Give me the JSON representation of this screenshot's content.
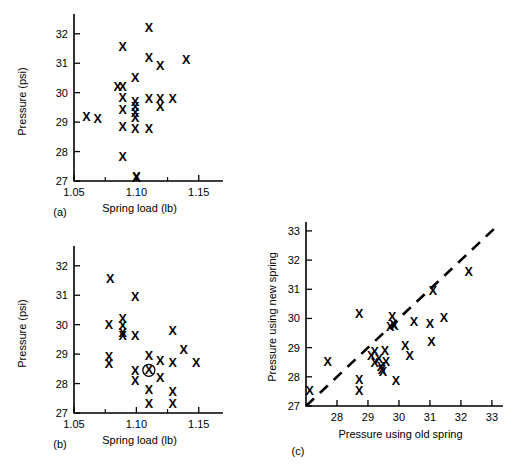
{
  "figure": {
    "marker_glyph": "X",
    "ink_color": "#000000",
    "background": "#ffffff"
  },
  "chart_data": [
    {
      "id": "a",
      "type": "scatter",
      "panel_label": "(a)",
      "title": "",
      "xlabel": "Spring load (lb)",
      "ylabel": "Pressure (psi)",
      "xlim": [
        1.05,
        1.155
      ],
      "ylim": [
        27,
        32.4
      ],
      "xticks": [
        1.05,
        1.1,
        1.15
      ],
      "xticklabels": [
        "1.05",
        "1.10",
        "1.15"
      ],
      "xminorticks": [
        1.075,
        1.125
      ],
      "yticks": [
        27,
        28,
        29,
        30,
        31,
        32
      ],
      "yticklabels": [
        "27",
        "28",
        "29",
        "30",
        "31",
        "32"
      ],
      "grid": false,
      "legend": "none",
      "points": [
        [
          1.06,
          29.18
        ],
        [
          1.069,
          29.1
        ],
        [
          1.085,
          30.2
        ],
        [
          1.089,
          30.2
        ],
        [
          1.089,
          31.55
        ],
        [
          1.089,
          29.82
        ],
        [
          1.089,
          29.42
        ],
        [
          1.089,
          28.82
        ],
        [
          1.089,
          27.8
        ],
        [
          1.099,
          30.5
        ],
        [
          1.099,
          29.68
        ],
        [
          1.099,
          29.52
        ],
        [
          1.099,
          29.32
        ],
        [
          1.099,
          29.15
        ],
        [
          1.099,
          28.75
        ],
        [
          1.1,
          27.15
        ],
        [
          1.1,
          27.1
        ],
        [
          1.11,
          32.18
        ],
        [
          1.11,
          31.18
        ],
        [
          1.11,
          29.78
        ],
        [
          1.11,
          28.75
        ],
        [
          1.119,
          30.92
        ],
        [
          1.119,
          29.78
        ],
        [
          1.119,
          29.5
        ],
        [
          1.129,
          29.78
        ],
        [
          1.14,
          31.1
        ]
      ]
    },
    {
      "id": "b",
      "type": "scatter",
      "panel_label": "(b)",
      "title": "",
      "xlabel": "Spring load (lb)",
      "ylabel": "Pressure (psi)",
      "xlim": [
        1.05,
        1.155
      ],
      "ylim": [
        27,
        32.4
      ],
      "xticks": [
        1.05,
        1.1,
        1.15
      ],
      "xticklabels": [
        "1.05",
        "1.10",
        "1.15"
      ],
      "xminorticks": [
        1.075,
        1.125
      ],
      "yticks": [
        27,
        28,
        29,
        30,
        31,
        32
      ],
      "yticklabels": [
        "27",
        "28",
        "29",
        "30",
        "31",
        "32"
      ],
      "grid": false,
      "legend": "none",
      "highlighted_point": [
        1.11,
        28.45
      ],
      "points": [
        [
          1.079,
          31.55
        ],
        [
          1.078,
          30.0
        ],
        [
          1.078,
          28.9
        ],
        [
          1.078,
          28.68
        ],
        [
          1.089,
          30.18
        ],
        [
          1.089,
          29.95
        ],
        [
          1.089,
          29.72
        ],
        [
          1.089,
          29.62
        ],
        [
          1.099,
          30.95
        ],
        [
          1.099,
          29.62
        ],
        [
          1.099,
          28.42
        ],
        [
          1.099,
          28.1
        ],
        [
          1.11,
          28.95
        ],
        [
          1.11,
          28.45
        ],
        [
          1.11,
          27.78
        ],
        [
          1.11,
          27.32
        ],
        [
          1.119,
          28.78
        ],
        [
          1.119,
          28.18
        ],
        [
          1.129,
          29.8
        ],
        [
          1.129,
          28.7
        ],
        [
          1.129,
          27.72
        ],
        [
          1.129,
          27.3
        ],
        [
          1.138,
          29.15
        ],
        [
          1.148,
          28.7
        ]
      ]
    },
    {
      "id": "c",
      "type": "scatter",
      "panel_label": "(c)",
      "title": "",
      "xlabel": "Pressure using old spring",
      "ylabel": "Pressure using new spring",
      "xlim": [
        27,
        33.1
      ],
      "ylim": [
        27,
        33.1
      ],
      "xticks": [
        28,
        29,
        30,
        31,
        32,
        33
      ],
      "xticklabels": [
        "28",
        "29",
        "30",
        "31",
        "32",
        "33"
      ],
      "yticks": [
        27,
        28,
        29,
        30,
        31,
        32,
        33
      ],
      "yticklabels": [
        "27",
        "28",
        "29",
        "30",
        "31",
        "32",
        "33"
      ],
      "grid": false,
      "legend": "none",
      "reference_line": {
        "style": "dashed",
        "from": [
          27.0,
          27.0
        ],
        "to": [
          33.1,
          33.1
        ],
        "description": "y = x identity line"
      },
      "points": [
        [
          27.12,
          27.5
        ],
        [
          27.7,
          28.5
        ],
        [
          28.72,
          30.15
        ],
        [
          28.72,
          27.88
        ],
        [
          28.72,
          27.52
        ],
        [
          29.1,
          28.72
        ],
        [
          29.22,
          28.85
        ],
        [
          29.22,
          28.48
        ],
        [
          29.35,
          28.62
        ],
        [
          29.42,
          28.32
        ],
        [
          29.45,
          28.22
        ],
        [
          29.48,
          28.18
        ],
        [
          29.55,
          28.88
        ],
        [
          29.58,
          28.5
        ],
        [
          29.72,
          29.72
        ],
        [
          29.78,
          30.05
        ],
        [
          29.82,
          29.78
        ],
        [
          29.85,
          29.75
        ],
        [
          29.9,
          27.85
        ],
        [
          30.2,
          29.05
        ],
        [
          30.35,
          28.72
        ],
        [
          30.48,
          29.88
        ],
        [
          31.0,
          29.82
        ],
        [
          31.05,
          29.18
        ],
        [
          31.1,
          30.95
        ],
        [
          31.45,
          30.0
        ],
        [
          32.25,
          31.58
        ]
      ]
    }
  ]
}
